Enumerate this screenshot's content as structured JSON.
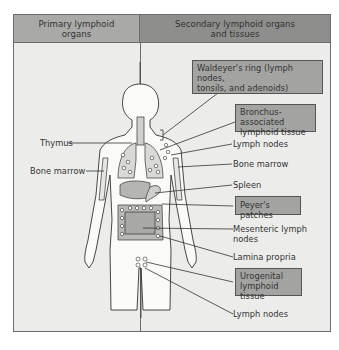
{
  "header": {
    "primary": "Primary lymphoid organs",
    "primary_line1": "Primary lymphoid",
    "primary_line2": "organs",
    "secondary_line1": "Secondary lymphoid organs",
    "secondary_line2": "and tissues"
  },
  "primary_labels": {
    "thymus": "Thymus",
    "bone_marrow": "Bone marrow"
  },
  "secondary_labels": {
    "waldeyer_line1": "Waldeyer's ring (lymph nodes,",
    "waldeyer_line2": "tonsils, and adenoids)",
    "balt_line1": "Bronchus-associated",
    "balt_line2": "lymphoid tissue",
    "lymph_nodes_upper": "Lymph nodes",
    "bone_marrow": "Bone marrow",
    "spleen": "Spleen",
    "peyers": "Peyer's patches",
    "mesenteric_line1": "Mesenteric lymph",
    "mesenteric_line2": "nodes",
    "lamina_propria": "Lamina propria",
    "urogenital_line1": "Urogenital",
    "urogenital_line2": "lymphoid tissue",
    "lymph_nodes_lower": "Lymph nodes"
  },
  "colors": {
    "panel_bg": "#ececea",
    "header_left": "#a9a9a7",
    "header_right": "#8e8e8c",
    "highlight_box": "#a3a3a1",
    "line": "#333333"
  }
}
